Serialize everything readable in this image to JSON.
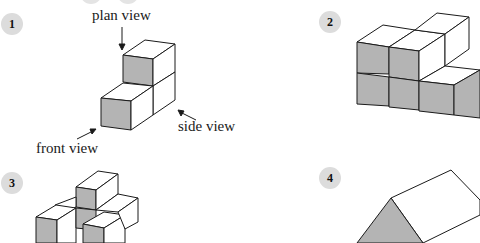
{
  "figures": [
    {
      "number": "1",
      "labels": {
        "plan": "plan view",
        "side": "side view",
        "front": "front view"
      }
    },
    {
      "number": "2"
    },
    {
      "number": "3"
    },
    {
      "number": "4"
    }
  ],
  "colors": {
    "shaded_face": "#b4b4b4",
    "badge": "#dcdcdc",
    "line": "#1a1a1a"
  }
}
